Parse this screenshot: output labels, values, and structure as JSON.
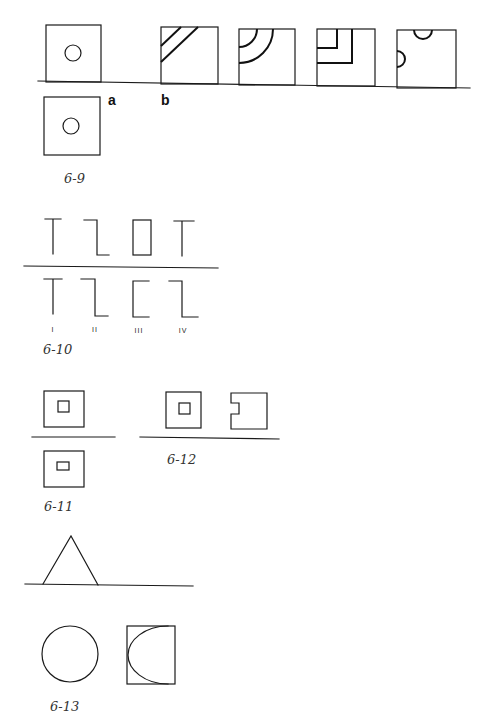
{
  "figures": [
    {
      "id": "6-9",
      "caption": "6-9",
      "labels": {
        "a": "a",
        "b": "b"
      },
      "description": "Square with centered circle; reference square above baseline and candidate squares b with diagonal bands, quarter arcs, nested L corners, semicircle notches"
    },
    {
      "id": "6-10",
      "caption": "6-10",
      "top_row": [
        "T-shape",
        "Z-bracket",
        "rectangle",
        "T-shape"
      ],
      "bottom_row": [
        "T-shape",
        "Z-bracket",
        "C-bracket",
        "Z-bracket"
      ],
      "roman_labels": [
        "I",
        "II",
        "III",
        "IV"
      ]
    },
    {
      "id": "6-11",
      "caption": "6-11",
      "description": "Square with small inner square above line, square with smaller inner rectangle below line"
    },
    {
      "id": "6-12",
      "caption": "6-12",
      "description": "Square with inner square, and square with notch cut on left edge"
    },
    {
      "id": "6-13",
      "caption": "6-13",
      "description": "Triangle above line; circle and square containing half-ellipse below"
    }
  ],
  "colors": {
    "stroke": "#1a1a1a",
    "background": "#ffffff",
    "caption": "#333333"
  }
}
